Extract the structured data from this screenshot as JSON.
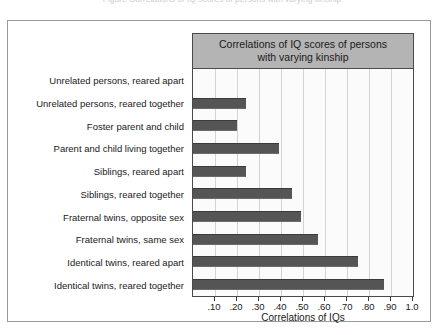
{
  "top_clip_text": "Figure  Correlations of IQ scores of persons with varying kinship",
  "chart_data": {
    "type": "bar",
    "orientation": "horizontal",
    "title": "Correlations of IQ scores of persons with varying kinship",
    "title_line1": "Correlations of IQ scores of persons",
    "title_line2": "with varying kinship",
    "xlabel": "Correlations of IQs",
    "ylabel": "",
    "xlim": [
      0,
      1.0
    ],
    "xticks": [
      0.1,
      0.2,
      0.3,
      0.4,
      0.5,
      0.6,
      0.7,
      0.8,
      0.9,
      1.0
    ],
    "xtick_labels": [
      ".10",
      ".20",
      ".30",
      ".40",
      ".50",
      ".60",
      ".70",
      ".80",
      ".90",
      "1.0"
    ],
    "grid": true,
    "legend": false,
    "bar_color": "#555555",
    "title_bg_color": "#b4b4b4",
    "categories": [
      "Unrelated persons, reared apart",
      "Unrelated persons, reared together",
      "Foster parent and child",
      "Parent and child living together",
      "Siblings, reared apart",
      "Siblings, reared together",
      "Fraternal twins, opposite sex",
      "Fraternal twins, same sex",
      "Identical twins, reared apart",
      "Identical twins, reared together"
    ],
    "values": [
      0.0,
      0.24,
      0.2,
      0.39,
      0.24,
      0.45,
      0.49,
      0.57,
      0.75,
      0.87
    ]
  }
}
